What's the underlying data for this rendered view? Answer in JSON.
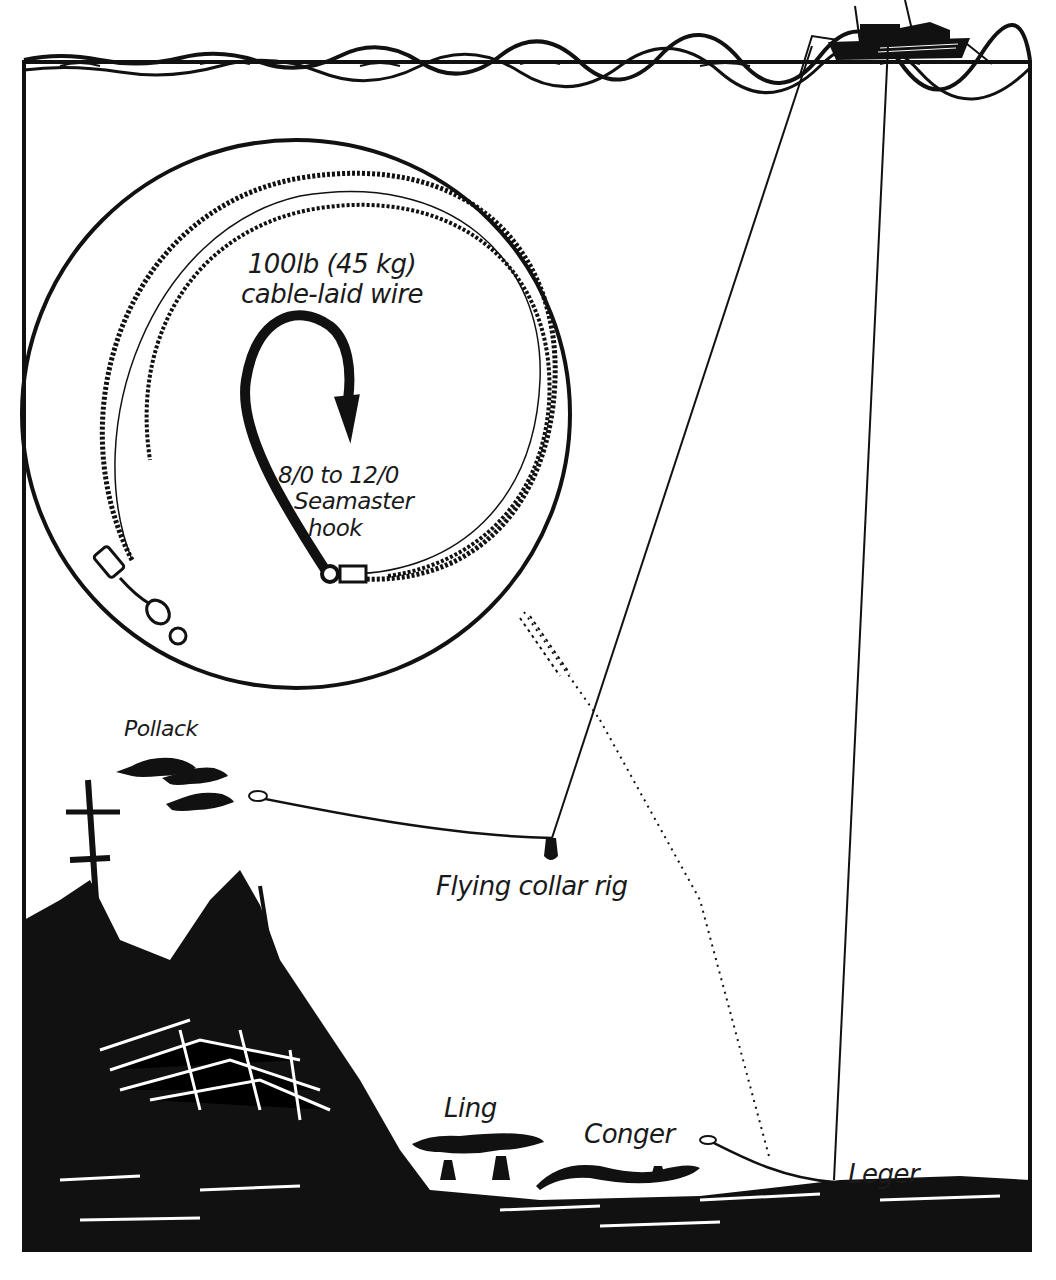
{
  "diagram": {
    "type": "fishing-rig-illustration",
    "colors": {
      "ink": "#111111",
      "paper": "#ffffff"
    },
    "inset": {
      "wire_label_line1": "100lb (45 kg)",
      "wire_label_line2": "cable-laid wire",
      "hook_label_line1": "8/0 to 12/0",
      "hook_label_line2": "Seamaster",
      "hook_label_line3": "hook"
    },
    "labels": {
      "pollack": "Pollack",
      "flying_collar": "Flying collar rig",
      "ling": "Ling",
      "conger": "Conger",
      "leger": "Leger"
    }
  }
}
